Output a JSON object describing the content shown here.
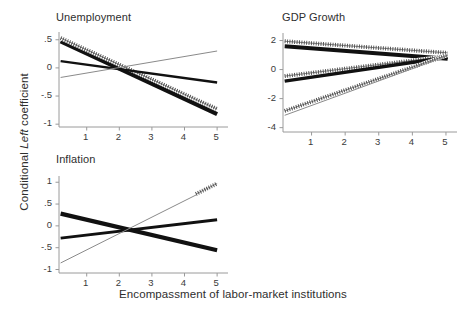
{
  "figure": {
    "ylabel": "Conditional Left coefficient",
    "ylabel_italic_word": "Left",
    "xlabel": "Encompassment of labor-market institutions",
    "background": "#ffffff",
    "ink": "#222222",
    "gray": "#8a8a8a"
  },
  "panels": {
    "unemployment": {
      "title": "Unemployment"
    },
    "gdp": {
      "title": "GDP Growth"
    },
    "inflation": {
      "title": "Inflation"
    }
  },
  "ticks": {
    "x_common": [
      "1",
      "2",
      "3",
      "4",
      "5"
    ],
    "unemployment_y": [
      ".5",
      "0",
      "-.5",
      "-1"
    ],
    "gdp_y": [
      "2",
      "0",
      "-2",
      "-4"
    ],
    "inflation_y": [
      "1",
      ".5",
      "0",
      "-.5",
      "-1"
    ]
  },
  "chart_data": {
    "type": "line",
    "xlabel": "Encompassment of labor-market institutions",
    "ylabel": "Conditional Left coefficient",
    "grid": false,
    "legend": "none",
    "panel_layout": "2x2 (bottom-right empty)",
    "panels": [
      {
        "name": "unemployment",
        "title": "Unemployment",
        "xlim": [
          0.15,
          5.15
        ],
        "ylim": [
          -1.05,
          0.62
        ],
        "xticks": [
          1,
          2,
          3,
          4,
          5
        ],
        "yticks": [
          0.5,
          0,
          -0.5,
          -1
        ],
        "ytick_labels": [
          ".5",
          "0",
          "-.5",
          "-1"
        ],
        "series": [
          {
            "name": "estimate-thick",
            "style": "thick-solid",
            "color": "#111111",
            "width": 4.2,
            "x": [
              0.2,
              5.0
            ],
            "y": [
              0.47,
              -0.82
            ]
          },
          {
            "name": "estimate-stippled",
            "style": "stippled",
            "color": "#4a4a4a",
            "width": 4.0,
            "x": [
              0.2,
              5.0
            ],
            "y": [
              0.53,
              -0.73
            ]
          },
          {
            "name": "estimate-medium",
            "style": "medium-solid",
            "color": "#111111",
            "width": 2.4,
            "x": [
              0.2,
              5.0
            ],
            "y": [
              0.12,
              -0.26
            ]
          },
          {
            "name": "estimate-thin",
            "style": "thin-solid",
            "color": "#8a8a8a",
            "width": 1.0,
            "x": [
              0.2,
              5.0
            ],
            "y": [
              -0.17,
              0.3
            ]
          }
        ]
      },
      {
        "name": "gdp",
        "title": "GDP Growth",
        "xlim": [
          0.15,
          5.15
        ],
        "ylim": [
          -4.3,
          2.45
        ],
        "xticks": [
          1,
          2,
          3,
          4,
          5
        ],
        "yticks": [
          2,
          0,
          -2,
          -4
        ],
        "ytick_labels": [
          "2",
          "0",
          "-2",
          "-4"
        ],
        "series": [
          {
            "name": "upper-stippled",
            "style": "stippled",
            "color": "#4a4a4a",
            "width": 4.0,
            "x": [
              0.2,
              5.05
            ],
            "y": [
              1.95,
              1.15
            ]
          },
          {
            "name": "upper-thick",
            "style": "thick-solid",
            "color": "#111111",
            "width": 4.0,
            "x": [
              0.2,
              5.05
            ],
            "y": [
              1.6,
              0.75
            ]
          },
          {
            "name": "middle-stippled",
            "style": "stippled",
            "color": "#4a4a4a",
            "width": 4.0,
            "x": [
              0.2,
              5.05
            ],
            "y": [
              -0.45,
              0.92
            ]
          },
          {
            "name": "middle-thick",
            "style": "thick-solid",
            "color": "#111111",
            "width": 3.4,
            "x": [
              0.2,
              5.05
            ],
            "y": [
              -0.8,
              0.85
            ]
          },
          {
            "name": "lower-stippled",
            "style": "stippled",
            "color": "#4a4a4a",
            "width": 4.0,
            "x": [
              0.2,
              5.05
            ],
            "y": [
              -2.85,
              1.0
            ]
          },
          {
            "name": "lower-thin",
            "style": "thin-solid",
            "color": "#8a8a8a",
            "width": 1.0,
            "x": [
              0.2,
              5.05
            ],
            "y": [
              -3.15,
              0.95
            ]
          }
        ]
      },
      {
        "name": "inflation",
        "title": "Inflation",
        "xlim": [
          0.15,
          5.15
        ],
        "ylim": [
          -1.08,
          1.12
        ],
        "xticks": [
          1,
          2,
          3,
          4,
          5
        ],
        "yticks": [
          1,
          0.5,
          0,
          -0.5,
          -1
        ],
        "ytick_labels": [
          "1",
          ".5",
          "0",
          "-.5",
          "-1"
        ],
        "series": [
          {
            "name": "declining-thick",
            "style": "thick-solid",
            "color": "#111111",
            "width": 4.2,
            "x": [
              0.2,
              5.0
            ],
            "y": [
              0.28,
              -0.56
            ]
          },
          {
            "name": "rising-medium",
            "style": "medium-solid",
            "color": "#111111",
            "width": 2.8,
            "x": [
              0.2,
              5.0
            ],
            "y": [
              -0.28,
              0.14
            ]
          },
          {
            "name": "rising-thin",
            "style": "thin-solid",
            "color": "#8a8a8a",
            "width": 1.0,
            "x": [
              0.2,
              5.0
            ],
            "y": [
              -0.85,
              0.95
            ]
          },
          {
            "name": "rising-stippled-segment",
            "style": "stippled",
            "color": "#4a4a4a",
            "width": 4.0,
            "x": [
              4.35,
              5.0
            ],
            "y": [
              0.73,
              0.97
            ]
          }
        ]
      }
    ]
  }
}
